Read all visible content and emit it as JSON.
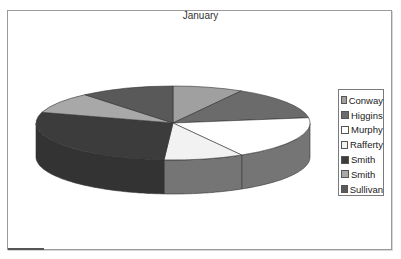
{
  "chart_data": {
    "type": "pie",
    "variant": "3d-pie",
    "title": "January",
    "legend_position": "right",
    "categories": [
      "Conway",
      "Higgins",
      "Murphy",
      "Rafferty",
      "Smith",
      "Smith",
      "Sullivan"
    ],
    "values": [
      8.3,
      14.4,
      18.9,
      9.4,
      28.6,
      9.2,
      11.1
    ],
    "value_unit": "percent (estimated from slice angles)",
    "colors": [
      "#a0a0a0",
      "#6b6b6b",
      "#ffffff",
      "#f2f2f2",
      "#3c3c3c",
      "#a8a8a8",
      "#595959"
    ]
  },
  "chart": {
    "title": "January",
    "legend": [
      {
        "label": "Conway",
        "color": "#a0a0a0"
      },
      {
        "label": "Higgins",
        "color": "#6b6b6b"
      },
      {
        "label": "Murphy",
        "color": "#ffffff"
      },
      {
        "label": "Rafferty",
        "color": "#f2f2f2"
      },
      {
        "label": "Smith",
        "color": "#3c3c3c"
      },
      {
        "label": "Smith",
        "color": "#a8a8a8"
      },
      {
        "label": "Sullivan",
        "color": "#595959"
      }
    ]
  }
}
